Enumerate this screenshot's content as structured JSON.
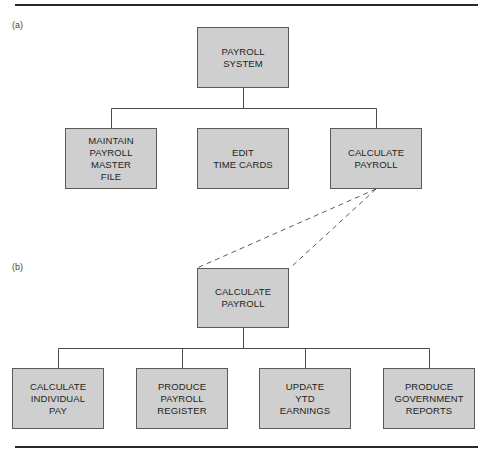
{
  "diagram": {
    "type": "hierarchy-chart",
    "colors": {
      "box_fill": "#cfcfcf",
      "box_border": "#5a5a5a",
      "line": "#4a4a4a",
      "rule": "#2a2a2a"
    },
    "panel_a": {
      "label": "(a)",
      "root": {
        "text": "PAYROLL\nSYSTEM"
      },
      "children": [
        {
          "text": "MAINTAIN\nPAYROLL\nMASTER\nFILE"
        },
        {
          "text": "EDIT\nTIME CARDS"
        },
        {
          "text": "CALCULATE\nPAYROLL"
        }
      ]
    },
    "panel_b": {
      "label": "(b)",
      "root": {
        "text": "CALCULATE\nPAYROLL"
      },
      "children": [
        {
          "text": "CALCULATE\nINDIVIDUAL\nPAY"
        },
        {
          "text": "PRODUCE\nPAYROLL\nREGISTER"
        },
        {
          "text": "UPDATE\nYTD\nEARNINGS"
        },
        {
          "text": "PRODUCE\nGOVERNMENT\nREPORTS"
        }
      ]
    },
    "expansion": {
      "from": "panel_a.children.2",
      "to": "panel_b.root",
      "style": "dashed"
    }
  }
}
